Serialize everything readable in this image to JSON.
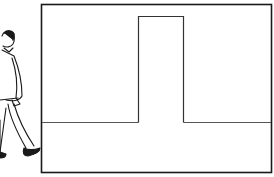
{
  "illustration": {
    "subject": "man walking toward framed doorway",
    "colors": {
      "background": "#ffffff",
      "line": "#1a1a1a",
      "thin_line": "#444444"
    },
    "elements": [
      "walking-man-figure",
      "outer-frame",
      "doorway-outline",
      "floor-line"
    ]
  }
}
